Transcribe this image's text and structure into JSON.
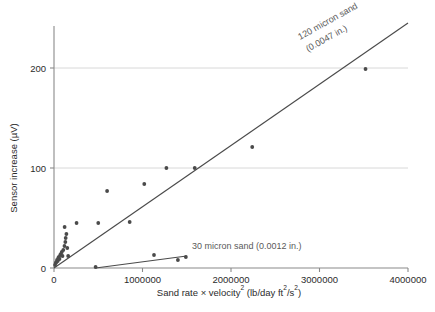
{
  "chart_data": {
    "type": "scatter",
    "title": "",
    "xlabel": "Sand rate × velocity² (lb/day ft²/s²)",
    "ylabel": "Sensor increase (µV)",
    "xlim": [
      0,
      4000000
    ],
    "ylim": [
      0,
      245
    ],
    "xticks": [
      0,
      1000000,
      2000000,
      3000000,
      4000000
    ],
    "xtick_labels": [
      "0",
      "1000000",
      "2000000",
      "3000000",
      "4000000"
    ],
    "yticks": [
      0,
      100,
      200
    ],
    "ytick_labels": [
      "0",
      "100",
      "200"
    ],
    "grid": "horizontal",
    "legend_position": "inline-annotation",
    "marker_color": "#4a4a4a",
    "line_color": "#4a4a4a",
    "grid_color": "#d8d8d8",
    "axis_color": "#8a8a8a",
    "series": [
      {
        "name": "120 micron sand (0.0047 in.)",
        "label": "120 micron sand\n(0.0047 in.)",
        "label_line1": "120 micron sand",
        "label_line2": "(0.0047 in.)",
        "points": [
          [
            12000,
            3
          ],
          [
            20000,
            5
          ],
          [
            28000,
            6
          ],
          [
            34000,
            8
          ],
          [
            42000,
            7
          ],
          [
            48000,
            10
          ],
          [
            55000,
            11
          ],
          [
            62000,
            9
          ],
          [
            70000,
            13
          ],
          [
            78000,
            14
          ],
          [
            88000,
            16
          ],
          [
            96000,
            12
          ],
          [
            105000,
            18
          ],
          [
            118000,
            22
          ],
          [
            128000,
            26
          ],
          [
            132000,
            30
          ],
          [
            140000,
            34
          ],
          [
            150000,
            20
          ],
          [
            160000,
            12
          ],
          [
            120000,
            41
          ],
          [
            255000,
            45
          ],
          [
            600000,
            77
          ],
          [
            500000,
            45
          ],
          [
            855000,
            46
          ],
          [
            1020000,
            84
          ],
          [
            1270000,
            100
          ],
          [
            1590000,
            100
          ],
          [
            2240000,
            121
          ],
          [
            3520000,
            199
          ]
        ],
        "fit_line": {
          "x1": 0,
          "y1": 0,
          "x2": 4000000,
          "y2": 245
        }
      },
      {
        "name": "30 micron sand (0.0012 in.)",
        "label": "30 micron sand (0.0012 in.)",
        "points": [
          [
            470000,
            1
          ],
          [
            1130000,
            13
          ],
          [
            1400000,
            8
          ],
          [
            1490000,
            11
          ]
        ],
        "fit_line": {
          "x1": 470000,
          "y1": 0,
          "x2": 1500000,
          "y2": 12
        }
      }
    ]
  }
}
